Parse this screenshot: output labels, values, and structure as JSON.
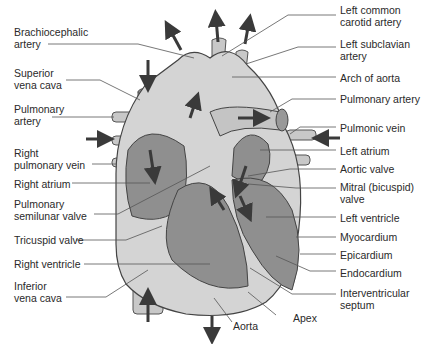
{
  "diagram": {
    "colors": {
      "outer_tissue": "#d4d4d4",
      "chamber": "#8f8f8f",
      "vessel": "#c8c8c8",
      "arrow": "#3a3a3a",
      "label_line": "#555555"
    },
    "labels_left": [
      {
        "id": "brachiocephalic-artery",
        "text": "Brachiocephalic\nartery"
      },
      {
        "id": "superior-vena-cava",
        "text": "Superior\nvena cava"
      },
      {
        "id": "pulmonary-artery-left",
        "text": "Pulmonary\nartery"
      },
      {
        "id": "right-pulmonary-vein",
        "text": "Right\npulmonary vein"
      },
      {
        "id": "right-atrium",
        "text": "Right atrium"
      },
      {
        "id": "pulmonary-semilunar-valve",
        "text": "Pulmonary\nsemilunar valve"
      },
      {
        "id": "tricuspid-valve",
        "text": "Tricuspid valve"
      },
      {
        "id": "right-ventricle",
        "text": "Right ventricle"
      },
      {
        "id": "inferior-vena-cava",
        "text": "Inferior\nvena cava"
      }
    ],
    "labels_right": [
      {
        "id": "left-common-carotid-artery",
        "text": "Left common\ncarotid artery"
      },
      {
        "id": "left-subclavian-artery",
        "text": "Left subclavian\nartery"
      },
      {
        "id": "arch-of-aorta",
        "text": "Arch of aorta"
      },
      {
        "id": "pulmonary-artery-right",
        "text": "Pulmonary artery"
      },
      {
        "id": "pulmonic-vein",
        "text": "Pulmonic vein"
      },
      {
        "id": "left-atrium",
        "text": "Left atrium"
      },
      {
        "id": "aortic-valve",
        "text": "Aortic valve"
      },
      {
        "id": "mitral-valve",
        "text": "Mitral (bicuspid)\nvalve"
      },
      {
        "id": "left-ventricle",
        "text": "Left ventricle"
      },
      {
        "id": "myocardium",
        "text": "Myocardium"
      },
      {
        "id": "epicardium",
        "text": "Epicardium"
      },
      {
        "id": "endocardium",
        "text": "Endocardium"
      },
      {
        "id": "interventricular-septum",
        "text": "Interventricular\nseptum"
      }
    ],
    "labels_bottom": [
      {
        "id": "aorta",
        "text": "Aorta"
      },
      {
        "id": "apex",
        "text": "Apex"
      }
    ]
  }
}
